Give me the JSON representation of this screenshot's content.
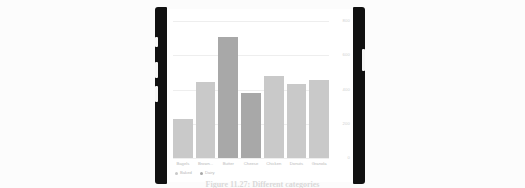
{
  "page": {
    "background_color": "#fcfcfc",
    "caption": "Figure 11.27: Different categories"
  },
  "device": {
    "frame_color": "#111111",
    "screen_color": "#ffffff",
    "left_buttons": [
      "silent-switch",
      "volume-up-button",
      "volume-down-button"
    ],
    "right_buttons": [
      "power-button"
    ]
  },
  "chart_data": {
    "type": "bar",
    "title": "",
    "xlabel": "",
    "ylabel": "",
    "categories": [
      "Bagels",
      "Brown...",
      "Butter",
      "Cheese",
      "Chicken",
      "Donuts",
      "Granola"
    ],
    "values": [
      229,
      446,
      708,
      381,
      479,
      433,
      454
    ],
    "group_of_bar": [
      "Baked",
      "Baked",
      "Dairy",
      "Dairy",
      "Baked",
      "Baked",
      "Baked"
    ],
    "ylim": [
      0,
      800
    ],
    "yticks": [
      0,
      200,
      400,
      600,
      800
    ],
    "ytick_labels": [
      "0",
      "200",
      "400",
      "600",
      "800"
    ],
    "grid": true,
    "legend_position": "bottom-left",
    "legend": [
      {
        "name": "Baked",
        "color": "#c9c9c9"
      },
      {
        "name": "Dairy",
        "color": "#a8a8a8"
      }
    ],
    "series_colors": {
      "Baked": "#c9c9c9",
      "Dairy": "#a8a8a8"
    }
  }
}
